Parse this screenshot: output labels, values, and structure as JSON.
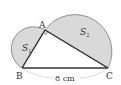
{
  "diagram": {
    "vertices": {
      "A": {
        "label": "A",
        "x": 45,
        "y": 30
      },
      "B": {
        "label": "B",
        "x": 22,
        "y": 68
      },
      "C": {
        "label": "C",
        "x": 108,
        "y": 68
      }
    },
    "regions": {
      "s1": {
        "label": "S",
        "sub": "1"
      },
      "s2": {
        "label": "S",
        "sub": "2"
      }
    },
    "side_bc": {
      "label": "8 cm"
    },
    "right_angle_at": "A",
    "colors": {
      "fill": "#d9d9d9",
      "stroke": "#333333",
      "dash": "#999999"
    }
  }
}
